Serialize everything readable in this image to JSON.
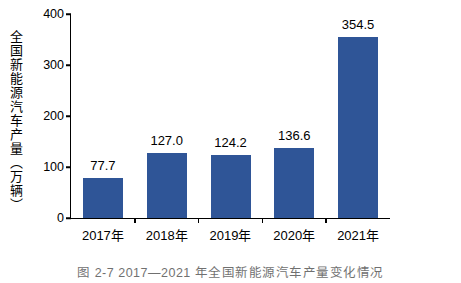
{
  "chart_data": {
    "type": "bar",
    "title": "",
    "xlabel": "",
    "ylabel": "全国新能源汽车产量（万辆）",
    "categories": [
      "2017年",
      "2018年",
      "2019年",
      "2020年",
      "2021年"
    ],
    "values": [
      77.7,
      127.0,
      124.2,
      136.6,
      354.5
    ],
    "data_labels": [
      "77.7",
      "127.0",
      "124.2",
      "136.6",
      "354.5"
    ],
    "ylim": [
      0,
      400
    ],
    "yticks": [
      0,
      100,
      200,
      300,
      400
    ],
    "ytick_labels": [
      "0",
      "100",
      "200",
      "300",
      "400"
    ],
    "grid": false,
    "legend": null,
    "bar_color": "#2f5597",
    "axis_color": "#000000"
  },
  "caption": "图 2-7  2017—2021 年全国新能源汽车产量变化情况"
}
